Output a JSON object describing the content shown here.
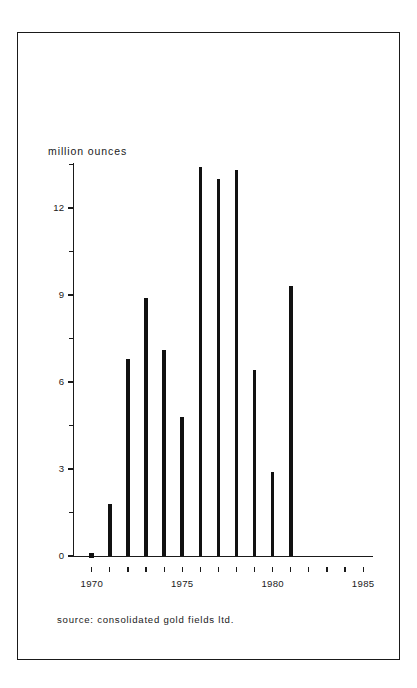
{
  "figure": {
    "background_color": "#ffffff",
    "ink_color": "#111111",
    "border_color": "#1a1a1a"
  },
  "source_note": "source: consolidated gold fields ltd.",
  "chart_data": {
    "type": "bar",
    "title": "",
    "subtitle": "",
    "xlabel": "",
    "ylabel": "million ounces",
    "categories": [
      "1970",
      "1971",
      "1972",
      "1973",
      "1974",
      "1975",
      "1976",
      "1977",
      "1978",
      "1979",
      "1980",
      "1981"
    ],
    "values": [
      0.05,
      1.8,
      6.8,
      8.9,
      7.1,
      4.8,
      13.4,
      13.0,
      13.3,
      6.4,
      2.9,
      9.3
    ],
    "xlim": [
      1969,
      1985.6
    ],
    "ylim": [
      0,
      14
    ],
    "yticks_major": [
      0,
      3,
      6,
      9,
      12
    ],
    "ytick_labels": [
      "0",
      "3",
      "6",
      "9",
      "12"
    ],
    "yticks_minor": [
      1.5,
      4.5,
      7.5,
      10.5,
      13.5
    ],
    "xticks": [
      1970,
      1971,
      1972,
      1973,
      1974,
      1975,
      1976,
      1977,
      1978,
      1979,
      1980,
      1981,
      1982,
      1983,
      1984,
      1985
    ],
    "xtick_labels_shown": [
      "1970",
      "1975",
      "1980",
      "1985"
    ],
    "grid": false,
    "legend": "none",
    "annotations": [
      "source: consolidated gold fields ltd."
    ]
  }
}
